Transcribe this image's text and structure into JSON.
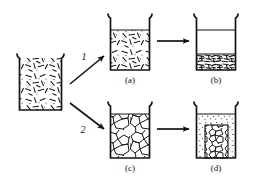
{
  "figure": {
    "background_color": "#ffffff",
    "ink_color": "#111111"
  },
  "source": {
    "name": "initial-suspension",
    "caption": "",
    "state": "uniform suspension of dispersed particles"
  },
  "paths": [
    {
      "id": "1",
      "label": "1",
      "description": "deflocculation route"
    },
    {
      "id": "2",
      "label": "2",
      "description": "flocculation route"
    }
  ],
  "beakers": [
    {
      "id": "source",
      "caption": "",
      "fill_style": "rods-dispersed",
      "fill_level_percent": 100,
      "sediment": false
    },
    {
      "id": "a",
      "caption": "(a)",
      "fill_style": "rods-dispersed",
      "fill_level_percent": 80,
      "sediment": false
    },
    {
      "id": "b",
      "caption": "(b)",
      "fill_style": "rods-settled",
      "fill_level_percent": 80,
      "sediment": true,
      "sediment_height_percent": 40
    },
    {
      "id": "c",
      "caption": "(c)",
      "fill_style": "floc-network",
      "fill_level_percent": 88,
      "sediment": false
    },
    {
      "id": "d",
      "caption": "(d)",
      "fill_style": "floc-settled",
      "fill_level_percent": 88,
      "sediment": true,
      "sediment_height_percent": 62
    }
  ],
  "arrows": [
    {
      "id": "arrow-path-1",
      "from": "source",
      "to": "a",
      "direction": "up-right"
    },
    {
      "id": "arrow-path-2",
      "from": "source",
      "to": "c",
      "direction": "down-right"
    },
    {
      "id": "arrow-a-to-b",
      "from": "a",
      "to": "b",
      "direction": "right"
    },
    {
      "id": "arrow-c-to-d",
      "from": "c",
      "to": "d",
      "direction": "right"
    }
  ],
  "captions": {
    "a": "(a)",
    "b": "(b)",
    "c": "(c)",
    "d": "(d)"
  }
}
